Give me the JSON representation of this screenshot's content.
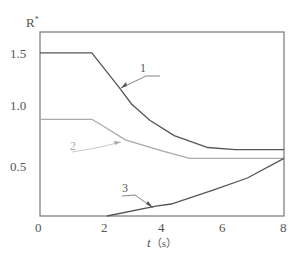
{
  "chart_data": {
    "type": "line",
    "title": "",
    "xlabel": "t（s）",
    "ylabel": "R*",
    "xlim": [
      0,
      8
    ],
    "ylim": [
      0,
      1.7
    ],
    "xticks": [
      "0",
      "2",
      "4",
      "6",
      "8"
    ],
    "yticks": [
      "0.5",
      "1.0",
      "1.5"
    ],
    "grid": false,
    "legend": "curve labels with leader lines (1, 2, 3)",
    "series": [
      {
        "name": "1",
        "color": "#555555",
        "x": [
          0,
          1.7,
          2.6,
          3.0,
          3.6,
          4.4,
          5.5,
          6.4,
          8
        ],
        "y": [
          1.5,
          1.5,
          1.18,
          1.03,
          0.88,
          0.74,
          0.63,
          0.61,
          0.61
        ]
      },
      {
        "name": "2",
        "color": "#aaaaaa",
        "x": [
          0,
          1.7,
          2.0,
          2.8,
          4.0,
          4.9,
          8
        ],
        "y": [
          0.89,
          0.89,
          0.84,
          0.7,
          0.6,
          0.53,
          0.53
        ]
      },
      {
        "name": "3",
        "color": "#555555",
        "x": [
          2.2,
          3.8,
          4.3,
          5.7,
          6.8,
          8
        ],
        "y": [
          0,
          0.09,
          0.11,
          0.24,
          0.35,
          0.53
        ]
      }
    ]
  },
  "labels": {
    "ylabel_base": "R",
    "ylabel_sup": "*",
    "xlabel_t": "t",
    "xlabel_unit": "（s）",
    "x0": "0",
    "x2": "2",
    "x4": "4",
    "x6": "6",
    "x8": "8",
    "y05": "0.5",
    "y10": "1.0",
    "y15": "1.5",
    "curve1": "1",
    "curve2": "2",
    "curve3": "3"
  }
}
